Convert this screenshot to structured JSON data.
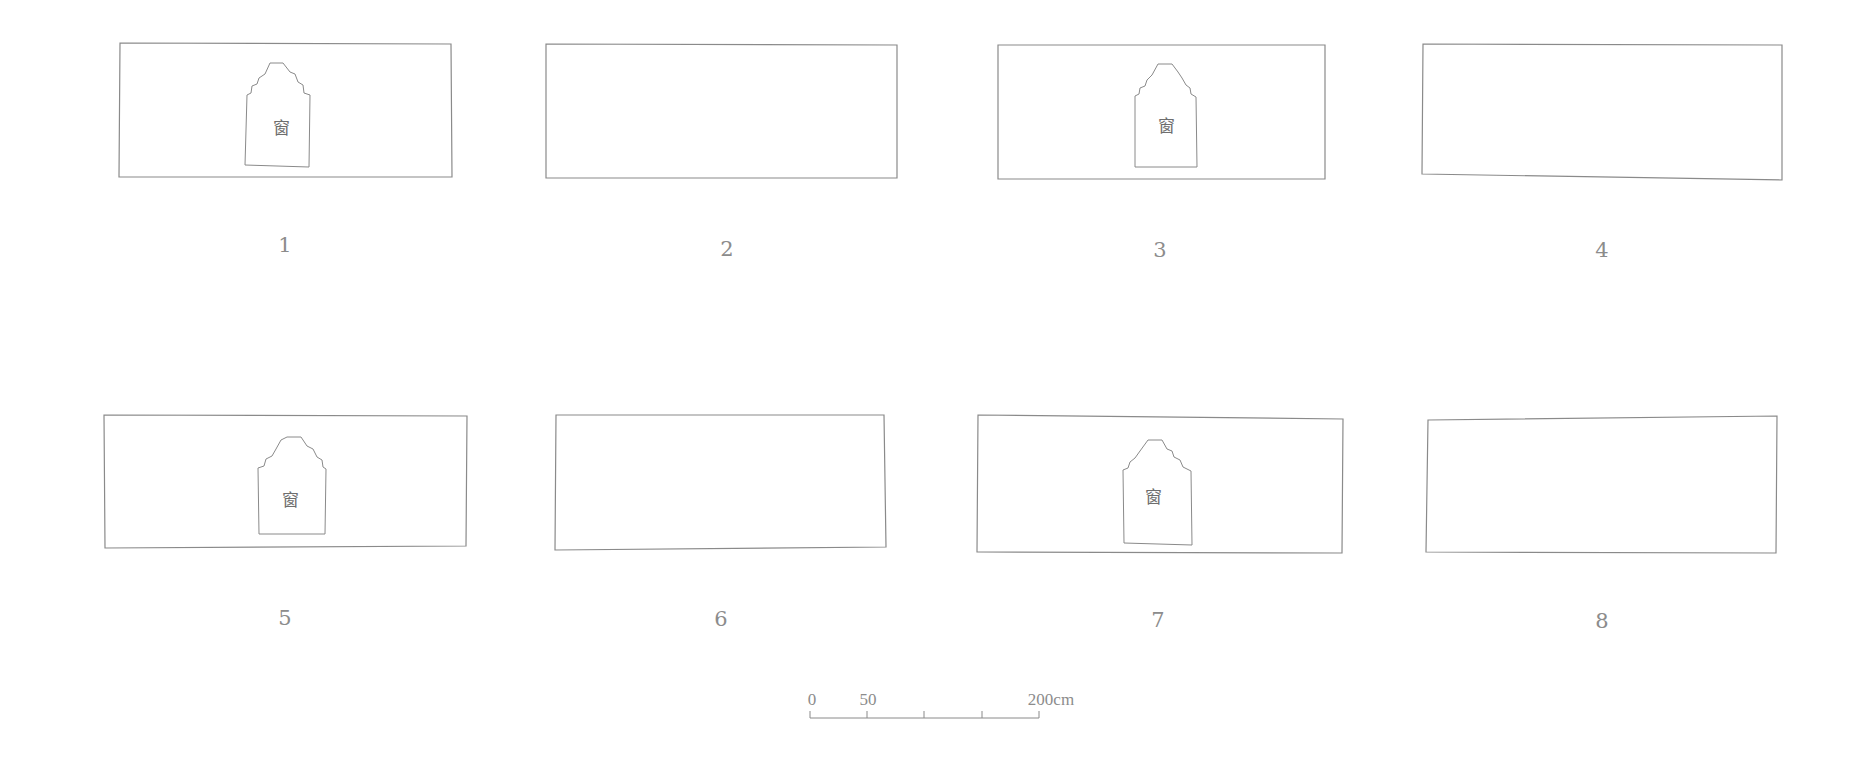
{
  "figure": {
    "panels": [
      {
        "number": "1",
        "has_window": true,
        "window_label": "窗",
        "outline": [
          [
            120,
            43
          ],
          [
            451,
            44
          ],
          [
            452,
            177
          ],
          [
            119,
            177
          ]
        ],
        "window": [
          [
            245,
            165
          ],
          [
            247,
            95
          ],
          [
            251,
            93
          ],
          [
            252,
            86
          ],
          [
            257,
            84
          ],
          [
            259,
            78
          ],
          [
            265,
            74
          ],
          [
            270,
            63
          ],
          [
            283,
            63
          ],
          [
            290,
            72
          ],
          [
            295,
            74
          ],
          [
            298,
            82
          ],
          [
            303,
            85
          ],
          [
            304,
            93
          ],
          [
            310,
            95
          ],
          [
            309,
            167
          ]
        ],
        "label_pos": [
          285,
          245
        ],
        "window_label_pos": [
          281,
          126
        ]
      },
      {
        "number": "2",
        "has_window": false,
        "outline": [
          [
            546,
            44
          ],
          [
            897,
            45
          ],
          [
            897,
            178
          ],
          [
            546,
            178
          ]
        ],
        "label_pos": [
          727,
          249
        ]
      },
      {
        "number": "3",
        "has_window": true,
        "window_label": "窗",
        "outline": [
          [
            998,
            45
          ],
          [
            1325,
            45
          ],
          [
            1325,
            179
          ],
          [
            998,
            179
          ]
        ],
        "window": [
          [
            1135,
            167
          ],
          [
            1135,
            96
          ],
          [
            1139,
            94
          ],
          [
            1140,
            88
          ],
          [
            1145,
            86
          ],
          [
            1147,
            80
          ],
          [
            1152,
            75
          ],
          [
            1158,
            64
          ],
          [
            1172,
            64
          ],
          [
            1178,
            72
          ],
          [
            1182,
            78
          ],
          [
            1186,
            85
          ],
          [
            1190,
            88
          ],
          [
            1191,
            94
          ],
          [
            1196,
            97
          ],
          [
            1197,
            167
          ]
        ],
        "label_pos": [
          1160,
          250
        ],
        "window_label_pos": [
          1166,
          124
        ]
      },
      {
        "number": "4",
        "has_window": false,
        "outline": [
          [
            1423,
            44
          ],
          [
            1782,
            45
          ],
          [
            1782,
            180
          ],
          [
            1422,
            174
          ]
        ],
        "label_pos": [
          1602,
          250
        ]
      },
      {
        "number": "5",
        "has_window": true,
        "window_label": "窗",
        "outline": [
          [
            104,
            415
          ],
          [
            467,
            416
          ],
          [
            466,
            546
          ],
          [
            105,
            548
          ]
        ],
        "window": [
          [
            259,
            534
          ],
          [
            258,
            468
          ],
          [
            264,
            466
          ],
          [
            266,
            459
          ],
          [
            272,
            456
          ],
          [
            276,
            449
          ],
          [
            281,
            440
          ],
          [
            287,
            437
          ],
          [
            301,
            437
          ],
          [
            307,
            446
          ],
          [
            313,
            449
          ],
          [
            317,
            457
          ],
          [
            322,
            460
          ],
          [
            323,
            467
          ],
          [
            326,
            469
          ],
          [
            325,
            534
          ]
        ],
        "label_pos": [
          285,
          618
        ],
        "window_label_pos": [
          290,
          498
        ]
      },
      {
        "number": "6",
        "has_window": false,
        "outline": [
          [
            556,
            415
          ],
          [
            884,
            415
          ],
          [
            886,
            547
          ],
          [
            555,
            550
          ]
        ],
        "label_pos": [
          721,
          619
        ]
      },
      {
        "number": "7",
        "has_window": true,
        "window_label": "窗",
        "outline": [
          [
            978,
            415
          ],
          [
            1343,
            419
          ],
          [
            1342,
            553
          ],
          [
            977,
            552
          ]
        ],
        "window": [
          [
            1124,
            543
          ],
          [
            1123,
            470
          ],
          [
            1128,
            468
          ],
          [
            1130,
            462
          ],
          [
            1135,
            458
          ],
          [
            1140,
            451
          ],
          [
            1148,
            440
          ],
          [
            1162,
            440
          ],
          [
            1167,
            449
          ],
          [
            1172,
            451
          ],
          [
            1174,
            457
          ],
          [
            1180,
            460
          ],
          [
            1183,
            467
          ],
          [
            1191,
            471
          ],
          [
            1192,
            545
          ]
        ],
        "label_pos": [
          1158,
          620
        ],
        "window_label_pos": [
          1153,
          495
        ]
      },
      {
        "number": "8",
        "has_window": false,
        "outline": [
          [
            1428,
            420
          ],
          [
            1777,
            416
          ],
          [
            1776,
            553
          ],
          [
            1426,
            552
          ]
        ],
        "label_pos": [
          1602,
          621
        ]
      }
    ],
    "scale_bar": {
      "labels": [
        {
          "text": "0",
          "x": 812,
          "y": 700
        },
        {
          "text": "50",
          "x": 868,
          "y": 700
        },
        {
          "text": "200cm",
          "x": 1051,
          "y": 700
        }
      ],
      "baseline_y": 718,
      "x_start": 810,
      "x_end": 1039,
      "ticks": [
        810,
        867,
        924,
        982,
        1039
      ],
      "tick_top_y": 711
    }
  }
}
